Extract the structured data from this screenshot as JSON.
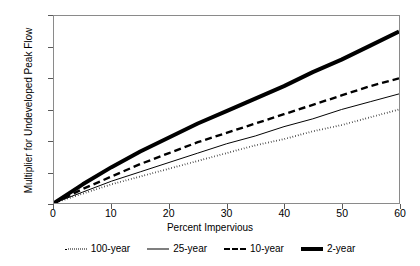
{
  "chart_data": {
    "type": "line",
    "title": "",
    "xlabel": "Percent Impervious",
    "ylabel": "Multiplier for Undeveloped Peak Flow",
    "xlim": [
      0,
      60
    ],
    "ylim": [
      1.0,
      2.2
    ],
    "xticks": [
      "0",
      "10",
      "20",
      "30",
      "40",
      "50",
      "60"
    ],
    "yticks": [
      "1.0",
      "1.2",
      "1.4",
      "1.6",
      "1.8",
      "2.0",
      "2.2"
    ],
    "grid": false,
    "legend_position": "below",
    "x": [
      0,
      5,
      10,
      15,
      20,
      25,
      30,
      35,
      40,
      45,
      50,
      55,
      60
    ],
    "series": [
      {
        "name": "100-year",
        "style": "dotted",
        "color": "#000000",
        "values": [
          1.0,
          1.06,
          1.12,
          1.17,
          1.22,
          1.27,
          1.32,
          1.37,
          1.41,
          1.46,
          1.5,
          1.55,
          1.6
        ]
      },
      {
        "name": "25-year",
        "style": "thin-solid",
        "color": "#000000",
        "values": [
          1.0,
          1.07,
          1.14,
          1.2,
          1.26,
          1.32,
          1.38,
          1.43,
          1.49,
          1.54,
          1.6,
          1.65,
          1.7
        ]
      },
      {
        "name": "10-year",
        "style": "dashed",
        "color": "#000000",
        "values": [
          1.0,
          1.09,
          1.17,
          1.25,
          1.32,
          1.39,
          1.45,
          1.51,
          1.57,
          1.63,
          1.69,
          1.75,
          1.8
        ]
      },
      {
        "name": "2-year",
        "style": "thick-solid",
        "color": "#000000",
        "values": [
          1.0,
          1.12,
          1.23,
          1.33,
          1.42,
          1.51,
          1.59,
          1.67,
          1.75,
          1.84,
          1.92,
          2.01,
          2.1
        ]
      }
    ]
  },
  "legend": {
    "items": [
      {
        "label": "100-year"
      },
      {
        "label": "25-year"
      },
      {
        "label": "10-year"
      },
      {
        "label": "2-year"
      }
    ]
  }
}
